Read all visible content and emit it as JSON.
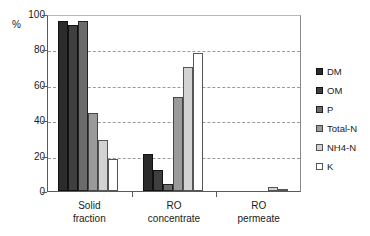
{
  "chart_data": {
    "type": "bar",
    "title": "",
    "subtitle": "",
    "xlabel": "",
    "ylabel": "%",
    "ylim": [
      0,
      100
    ],
    "yticks": [
      0,
      20,
      40,
      60,
      80,
      100
    ],
    "ytick_labels": [
      "0",
      "20",
      "40",
      "60",
      "80",
      "100"
    ],
    "grid": true,
    "grid_axis": "y",
    "legend_position": "right",
    "categories": [
      "Solid fraction",
      "RO concentrate",
      "RO permeate"
    ],
    "category_lines": [
      [
        "Solid",
        "fraction"
      ],
      [
        "RO",
        "concentrate"
      ],
      [
        "RO",
        "permeate"
      ]
    ],
    "series": [
      {
        "name": "DM",
        "color": "#2b2b2b",
        "edge": "#111111",
        "values": [
          96,
          21,
          0
        ]
      },
      {
        "name": "OM",
        "color": "#3f3f3f",
        "edge": "#111111",
        "values": [
          94,
          12,
          0
        ]
      },
      {
        "name": "P",
        "color": "#6b6b6b",
        "edge": "#222222",
        "values": [
          96,
          4,
          0
        ]
      },
      {
        "name": "Total-N",
        "color": "#9a9a9a",
        "edge": "#444444",
        "values": [
          44,
          53,
          0
        ]
      },
      {
        "name": "NH4-N",
        "color": "#d2d2d2",
        "edge": "#555555",
        "values": [
          29,
          70,
          2
        ]
      },
      {
        "name": "K",
        "color": "#ffffff",
        "edge": "#555555",
        "values": [
          18,
          78,
          1
        ]
      }
    ]
  },
  "legend": {
    "items": [
      {
        "label": "DM"
      },
      {
        "label": "OM"
      },
      {
        "label": "P"
      },
      {
        "label": "Total-N"
      },
      {
        "label": "NH4-N"
      },
      {
        "label": "K"
      }
    ]
  },
  "axis": {
    "y_unit": "%"
  }
}
